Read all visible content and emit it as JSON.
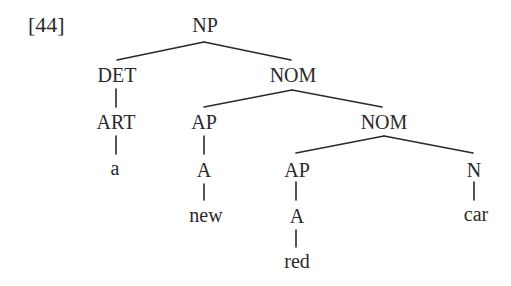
{
  "example_number": "[44]",
  "tree": {
    "nodes": [
      {
        "id": "np",
        "label": "NP",
        "x": 205,
        "y": 15
      },
      {
        "id": "det",
        "label": "DET",
        "x": 117,
        "y": 65
      },
      {
        "id": "nom1",
        "label": "NOM",
        "x": 293,
        "y": 65
      },
      {
        "id": "art",
        "label": "ART",
        "x": 116,
        "y": 112
      },
      {
        "id": "ap1",
        "label": "AP",
        "x": 204,
        "y": 112
      },
      {
        "id": "nom2",
        "label": "NOM",
        "x": 384,
        "y": 112
      },
      {
        "id": "word_a",
        "label": "a",
        "x": 115,
        "y": 158
      },
      {
        "id": "a1",
        "label": "A",
        "x": 204,
        "y": 160
      },
      {
        "id": "ap2",
        "label": "AP",
        "x": 297,
        "y": 160
      },
      {
        "id": "n",
        "label": "N",
        "x": 474,
        "y": 160
      },
      {
        "id": "word_new",
        "label": "new",
        "x": 206,
        "y": 207
      },
      {
        "id": "a2",
        "label": "A",
        "x": 297,
        "y": 206
      },
      {
        "id": "word_car",
        "label": "car",
        "x": 476,
        "y": 206
      },
      {
        "id": "word_red",
        "label": "red",
        "x": 297,
        "y": 253
      }
    ],
    "edges": [
      {
        "from": "NP",
        "to": "DET",
        "x1": 204,
        "y1": 42,
        "x2": 117,
        "y2": 60
      },
      {
        "from": "NP",
        "to": "NOM",
        "x1": 204,
        "y1": 42,
        "x2": 291,
        "y2": 60
      },
      {
        "from": "DET",
        "to": "ART",
        "x1": 116,
        "y1": 89,
        "x2": 116,
        "y2": 107
      },
      {
        "from": "NOM",
        "to": "AP",
        "x1": 292,
        "y1": 90,
        "x2": 204,
        "y2": 107
      },
      {
        "from": "NOM",
        "to": "NOM",
        "x1": 292,
        "y1": 90,
        "x2": 382,
        "y2": 107
      },
      {
        "from": "ART",
        "to": "a",
        "x1": 116,
        "y1": 136,
        "x2": 116,
        "y2": 154
      },
      {
        "from": "AP",
        "to": "A",
        "x1": 204,
        "y1": 136,
        "x2": 204,
        "y2": 154
      },
      {
        "from": "NOM",
        "to": "AP",
        "x1": 384,
        "y1": 136,
        "x2": 296,
        "y2": 153
      },
      {
        "from": "NOM",
        "to": "N",
        "x1": 384,
        "y1": 136,
        "x2": 473,
        "y2": 153
      },
      {
        "from": "A",
        "to": "new",
        "x1": 204,
        "y1": 184,
        "x2": 204,
        "y2": 200
      },
      {
        "from": "AP",
        "to": "A",
        "x1": 296,
        "y1": 182,
        "x2": 296,
        "y2": 200
      },
      {
        "from": "N",
        "to": "car",
        "x1": 474,
        "y1": 182,
        "x2": 474,
        "y2": 200
      },
      {
        "from": "A",
        "to": "red",
        "x1": 296,
        "y1": 230,
        "x2": 296,
        "y2": 247
      }
    ]
  }
}
